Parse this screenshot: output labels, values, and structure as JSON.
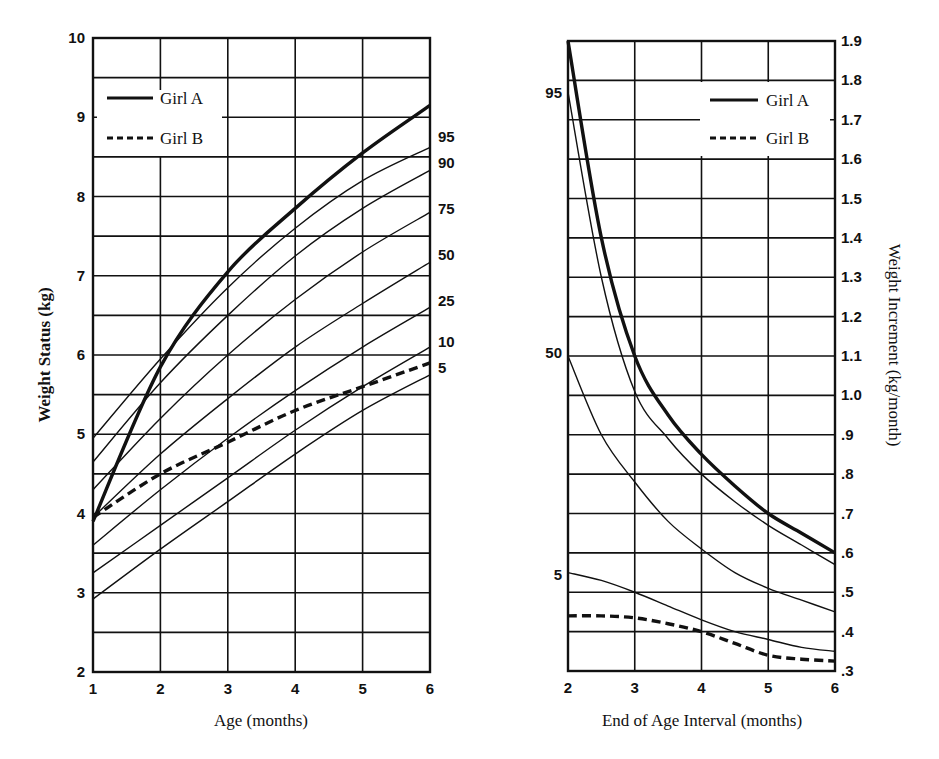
{
  "chart_data": [
    {
      "type": "line",
      "title": "",
      "xlabel": "Age (months)",
      "ylabel": "Weight Status (kg)",
      "xlim": [
        1,
        6
      ],
      "ylim": [
        2,
        10
      ],
      "x_ticks": [
        "1",
        "2",
        "3",
        "4",
        "5",
        "6"
      ],
      "y_ticks": [
        "2",
        "3",
        "4",
        "5",
        "6",
        "7",
        "8",
        "9",
        "10"
      ],
      "grid": true,
      "legend": {
        "position": "upper-left",
        "entries": [
          "Girl A",
          "Girl B"
        ]
      },
      "percentile_labels": [
        "95",
        "90",
        "75",
        "50",
        "25",
        "10",
        "5"
      ],
      "x": [
        1,
        2,
        3,
        4,
        5,
        6
      ],
      "series": [
        {
          "name": "Girl A",
          "style": "solid-thick",
          "values": [
            3.9,
            5.85,
            7.05,
            7.85,
            8.55,
            9.15
          ]
        },
        {
          "name": "Girl B",
          "style": "dashed-thick",
          "values": [
            3.95,
            4.5,
            4.9,
            5.3,
            5.6,
            5.9
          ]
        },
        {
          "name": "95th percentile",
          "style": "thin",
          "values": [
            4.95,
            5.95,
            6.85,
            7.6,
            8.2,
            8.62
          ]
        },
        {
          "name": "90th percentile",
          "style": "thin",
          "values": [
            4.65,
            5.65,
            6.5,
            7.25,
            7.85,
            8.33
          ]
        },
        {
          "name": "75th percentile",
          "style": "thin",
          "values": [
            4.3,
            5.2,
            6.0,
            6.7,
            7.3,
            7.8
          ]
        },
        {
          "name": "50th percentile",
          "style": "thin",
          "values": [
            3.95,
            4.75,
            5.45,
            6.1,
            6.65,
            7.17
          ]
        },
        {
          "name": "25th percentile",
          "style": "thin",
          "values": [
            3.6,
            4.3,
            4.95,
            5.55,
            6.1,
            6.6
          ]
        },
        {
          "name": "10th percentile",
          "style": "thin",
          "values": [
            3.25,
            3.85,
            4.45,
            5.05,
            5.6,
            6.1
          ]
        },
        {
          "name": "5th percentile",
          "style": "thin",
          "values": [
            2.92,
            3.55,
            4.15,
            4.75,
            5.3,
            5.75
          ]
        }
      ]
    },
    {
      "type": "line",
      "title": "",
      "xlabel": "End of Age Interval (months)",
      "ylabel": "Weight Increment (kg/month)",
      "y_axis_side": "right",
      "xlim": [
        2,
        6
      ],
      "ylim": [
        0.3,
        1.9
      ],
      "x_ticks": [
        "2",
        "3",
        "4",
        "5",
        "6"
      ],
      "y_ticks": [
        ".3",
        ".4",
        ".5",
        ".6",
        ".7",
        ".8",
        ".9",
        "1.0",
        "1.1",
        "1.2",
        "1.3",
        "1.4",
        "1.5",
        "1.6",
        "1.7",
        "1.8",
        "1.9"
      ],
      "grid": true,
      "legend": {
        "position": "upper-right",
        "entries": [
          "Girl A",
          "Girl B"
        ]
      },
      "percentile_labels": [
        {
          "label": "95",
          "y": 1.77
        },
        {
          "label": "50",
          "y": 1.1
        },
        {
          "label": "5",
          "y": 0.55
        }
      ],
      "x": [
        2,
        2.5,
        3,
        3.5,
        4,
        4.5,
        5,
        5.5,
        6
      ],
      "series": [
        {
          "name": "Girl A",
          "style": "solid-thick",
          "values": [
            1.9,
            1.4,
            1.1,
            0.95,
            0.85,
            0.77,
            0.7,
            0.65,
            0.6
          ]
        },
        {
          "name": "Girl B",
          "style": "dashed-thick",
          "values": [
            0.44,
            0.44,
            0.435,
            0.42,
            0.4,
            0.37,
            0.34,
            0.33,
            0.325
          ]
        },
        {
          "name": "95th percentile",
          "style": "thin",
          "values": [
            1.77,
            1.3,
            1.01,
            0.89,
            0.8,
            0.73,
            0.67,
            0.62,
            0.57
          ]
        },
        {
          "name": "50th percentile",
          "style": "thin",
          "values": [
            1.1,
            0.9,
            0.78,
            0.68,
            0.61,
            0.55,
            0.51,
            0.48,
            0.45
          ]
        },
        {
          "name": "5th percentile",
          "style": "thin",
          "values": [
            0.55,
            0.53,
            0.5,
            0.465,
            0.43,
            0.4,
            0.38,
            0.36,
            0.35
          ]
        }
      ]
    }
  ],
  "legend": {
    "girl_a": "Girl A",
    "girl_b": "Girl B"
  },
  "left_chart": {
    "xlabel": "Age (months)",
    "ylabel": "Weight Status (kg)"
  },
  "right_chart": {
    "xlabel": "End of Age Interval (months)",
    "ylabel": "Weight Increment (kg/month)"
  }
}
